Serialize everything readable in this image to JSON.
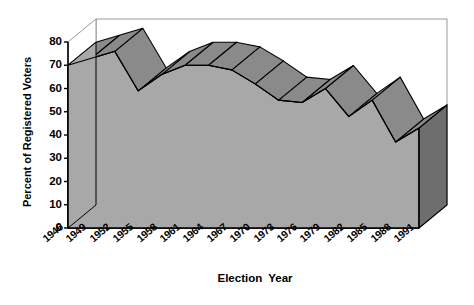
{
  "chart_data": {
    "type": "area",
    "title": "",
    "subtitle": "",
    "xlabel": "Election  Year",
    "ylabel": "Percent of Registered Voters",
    "categories": [
      "1946",
      "1949",
      "1952",
      "1955",
      "1958",
      "1961",
      "1964",
      "1967",
      "1970",
      "1973",
      "1976",
      "1979",
      "1982",
      "1985",
      "1988",
      "1991"
    ],
    "values": [
      70,
      73,
      76,
      59,
      66,
      70,
      70,
      68,
      62,
      55,
      54,
      60,
      48,
      55,
      37,
      43
    ],
    "series": [
      {
        "name": "Percent of Registered Voters",
        "values": [
          70,
          73,
          76,
          59,
          66,
          70,
          70,
          68,
          62,
          55,
          54,
          60,
          48,
          55,
          37,
          43
        ]
      }
    ],
    "ylim": [
      0,
      80
    ],
    "yticks": [
      0,
      10,
      20,
      30,
      40,
      50,
      60,
      70,
      80
    ],
    "ytick_labels": [
      "0",
      "10",
      "20",
      "30",
      "40",
      "50",
      "60",
      "70",
      "80"
    ],
    "grid": false,
    "legend": "none",
    "style": "3d-area-ribbon",
    "colors": {
      "area_face": "#a8a8a8",
      "ribbon_top": "#8a8a8a",
      "side_wall": "#6e6e6e",
      "outline": "#000000",
      "axis": "#000000",
      "background": "#ffffff",
      "floor": "#ffffff"
    }
  },
  "axis": {
    "y_title": "Percent of Registered Voters",
    "x_title": "Election  Year"
  }
}
